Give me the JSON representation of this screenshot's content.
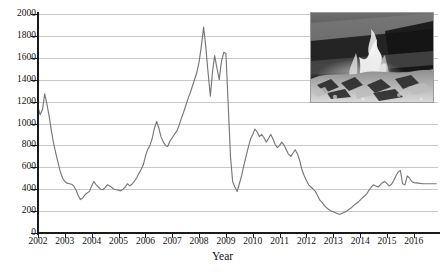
{
  "chart_data": {
    "type": "line",
    "title": "",
    "xlabel": "Year",
    "ylabel": "",
    "xlim": [
      2002,
      2016.9
    ],
    "ylim": [
      0,
      2000
    ],
    "grid": true,
    "legend": "none",
    "line_color": "#777777",
    "gridline_color": "#c9c9c9",
    "axis_color": "#1a1a1a",
    "y_ticks": [
      0,
      200,
      400,
      600,
      800,
      1000,
      1200,
      1400,
      1600,
      1800,
      2000
    ],
    "x_ticks": [
      2002,
      2003,
      2004,
      2005,
      2006,
      2007,
      2008,
      2009,
      2010,
      2011,
      2012,
      2013,
      2014,
      2015,
      2016
    ],
    "series": [
      {
        "name": "price",
        "x": [
          2002.0,
          2002.08,
          2002.17,
          2002.25,
          2002.33,
          2002.42,
          2002.5,
          2002.58,
          2002.67,
          2002.75,
          2002.83,
          2002.92,
          2003.0,
          2003.08,
          2003.17,
          2003.25,
          2003.33,
          2003.42,
          2003.5,
          2003.58,
          2003.67,
          2003.75,
          2003.83,
          2003.92,
          2004.0,
          2004.08,
          2004.17,
          2004.25,
          2004.33,
          2004.42,
          2004.5,
          2004.58,
          2004.67,
          2004.75,
          2004.83,
          2004.92,
          2005.0,
          2005.08,
          2005.17,
          2005.25,
          2005.33,
          2005.42,
          2005.5,
          2005.58,
          2005.67,
          2005.75,
          2005.83,
          2005.92,
          2006.0,
          2006.08,
          2006.17,
          2006.25,
          2006.33,
          2006.42,
          2006.5,
          2006.58,
          2006.67,
          2006.75,
          2006.83,
          2006.92,
          2007.0,
          2007.08,
          2007.17,
          2007.25,
          2007.33,
          2007.42,
          2007.5,
          2007.58,
          2007.67,
          2007.75,
          2007.83,
          2007.92,
          2008.0,
          2008.08,
          2008.17,
          2008.25,
          2008.33,
          2008.42,
          2008.5,
          2008.58,
          2008.67,
          2008.75,
          2008.83,
          2008.92,
          2009.0,
          2009.08,
          2009.17,
          2009.25,
          2009.33,
          2009.42,
          2009.5,
          2009.58,
          2009.67,
          2009.75,
          2009.83,
          2009.92,
          2010.0,
          2010.08,
          2010.17,
          2010.25,
          2010.33,
          2010.42,
          2010.5,
          2010.58,
          2010.67,
          2010.75,
          2010.83,
          2010.92,
          2011.0,
          2011.08,
          2011.17,
          2011.25,
          2011.33,
          2011.42,
          2011.5,
          2011.58,
          2011.67,
          2011.75,
          2011.83,
          2011.92,
          2012.0,
          2012.08,
          2012.17,
          2012.25,
          2012.33,
          2012.42,
          2012.5,
          2012.58,
          2012.67,
          2012.75,
          2012.83,
          2012.92,
          2013.0,
          2013.08,
          2013.17,
          2013.25,
          2013.33,
          2013.42,
          2013.5,
          2013.58,
          2013.67,
          2013.75,
          2013.83,
          2013.92,
          2014.0,
          2014.08,
          2014.17,
          2014.25,
          2014.33,
          2014.42,
          2014.5,
          2014.58,
          2014.67,
          2014.75,
          2014.83,
          2014.92,
          2015.0,
          2015.08,
          2015.17,
          2015.25,
          2015.33,
          2015.42,
          2015.5,
          2015.58,
          2015.67,
          2015.75,
          2015.83,
          2015.92,
          2016.0,
          2016.17,
          2016.33,
          2016.5,
          2016.67,
          2016.83
        ],
        "values": [
          1150,
          1080,
          1130,
          1270,
          1180,
          1060,
          930,
          820,
          720,
          640,
          560,
          500,
          470,
          455,
          450,
          445,
          430,
          390,
          340,
          305,
          320,
          350,
          365,
          380,
          430,
          470,
          440,
          420,
          400,
          395,
          415,
          440,
          430,
          415,
          400,
          395,
          390,
          385,
          400,
          420,
          450,
          430,
          445,
          470,
          500,
          540,
          575,
          620,
          700,
          760,
          800,
          860,
          950,
          1020,
          960,
          880,
          830,
          800,
          790,
          840,
          870,
          900,
          930,
          980,
          1040,
          1100,
          1160,
          1220,
          1280,
          1340,
          1400,
          1470,
          1560,
          1700,
          1880,
          1700,
          1480,
          1250,
          1470,
          1620,
          1500,
          1400,
          1560,
          1650,
          1640,
          1200,
          700,
          470,
          420,
          380,
          450,
          520,
          620,
          700,
          780,
          860,
          900,
          950,
          920,
          880,
          900,
          870,
          830,
          860,
          900,
          860,
          810,
          780,
          800,
          830,
          800,
          760,
          720,
          700,
          730,
          760,
          720,
          660,
          580,
          520,
          480,
          440,
          420,
          400,
          380,
          340,
          300,
          280,
          250,
          230,
          215,
          200,
          195,
          185,
          175,
          172,
          180,
          190,
          200,
          215,
          230,
          250,
          265,
          280,
          300,
          320,
          340,
          360,
          390,
          420,
          440,
          430,
          420,
          440,
          460,
          470,
          450,
          430,
          445,
          480,
          520,
          560,
          570,
          450,
          440,
          520,
          505,
          470,
          460,
          455,
          450,
          450,
          450,
          450
        ]
      }
    ]
  },
  "axis": {
    "x_title": "Year",
    "y_tick_labels": [
      "0",
      "200",
      "400",
      "600",
      "800",
      "1000",
      "1200",
      "1400",
      "1600",
      "1800",
      "2000"
    ],
    "x_tick_labels": [
      "2002",
      "2003",
      "2004",
      "2005",
      "2006",
      "2007",
      "2008",
      "2009",
      "2010",
      "2011",
      "2012",
      "2013",
      "2014",
      "2015",
      "2016"
    ]
  },
  "inset": {
    "name": "fire-photo",
    "description": "Grayscale photograph of flames burning a pile of material"
  }
}
